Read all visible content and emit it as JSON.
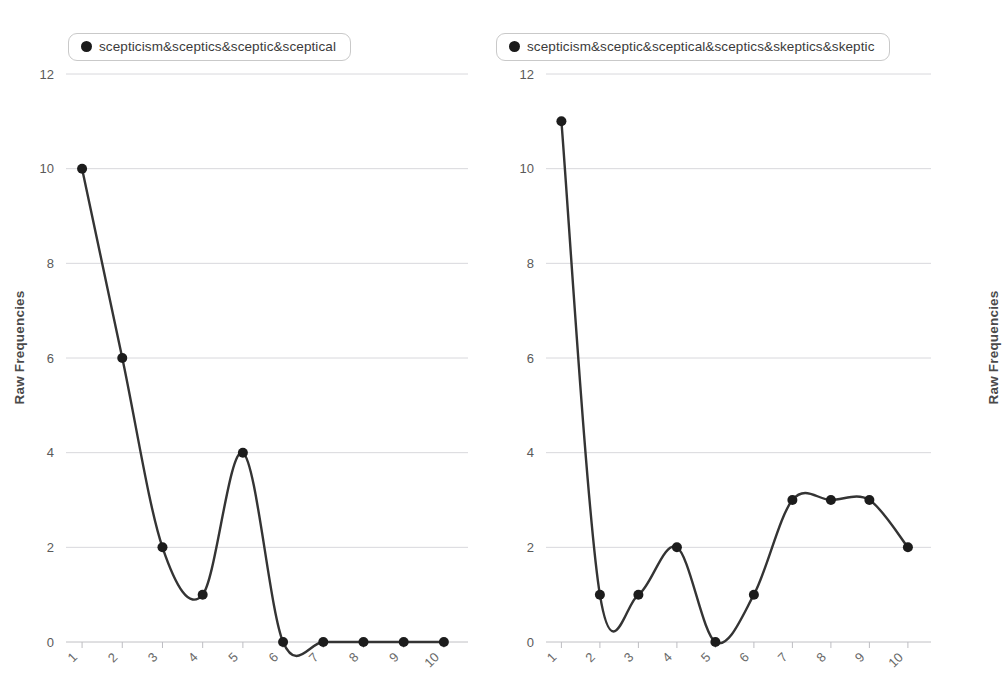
{
  "chart_data": [
    {
      "type": "line",
      "panel": "left",
      "title": "",
      "xlabel": "",
      "ylabel": "Raw Frequencies",
      "legend": "scepticism&sceptics&sceptic&sceptical",
      "legend_position": "top-left",
      "legend_marker": "filled-circle",
      "grid": true,
      "grid_axis": "y",
      "x": [
        1,
        2,
        3,
        4,
        5,
        6,
        7,
        8,
        9,
        10
      ],
      "xticklabels": [
        "1",
        "2",
        "3",
        "4",
        "5",
        "6",
        "7",
        "8",
        "9",
        "10"
      ],
      "xtick_rotation": -45,
      "yticks": [
        0,
        2,
        4,
        6,
        8,
        10,
        12
      ],
      "yticklabels": [
        "0",
        "2",
        "4",
        "6",
        "8",
        "10",
        "12"
      ],
      "ylim": [
        0,
        12
      ],
      "xlim": [
        0.6,
        10.6
      ],
      "interpolation": "smooth-spline",
      "values": [
        10,
        6,
        2,
        1,
        4,
        0,
        0,
        0,
        0,
        0
      ],
      "line_color": "#343434",
      "marker_color": "#1c1c1c"
    },
    {
      "type": "line",
      "panel": "right",
      "title": "",
      "xlabel": "",
      "ylabel": "Raw Frequencies",
      "legend": "scepticism&sceptic&sceptical&sceptics&skeptics&skeptic",
      "legend_position": "top-left",
      "legend_marker": "filled-circle",
      "grid": true,
      "grid_axis": "y",
      "x": [
        1,
        2,
        3,
        4,
        5,
        6,
        7,
        8,
        9,
        10
      ],
      "xticklabels": [
        "1",
        "2",
        "3",
        "4",
        "5",
        "6",
        "7",
        "8",
        "9",
        "10"
      ],
      "xtick_rotation": -45,
      "yticks": [
        0,
        2,
        4,
        6,
        8,
        10,
        12
      ],
      "yticklabels": [
        "0",
        "2",
        "4",
        "6",
        "8",
        "10",
        "12"
      ],
      "ylim": [
        0,
        12
      ],
      "xlim": [
        0.6,
        10.6
      ],
      "interpolation": "smooth-spline",
      "values": [
        11,
        1,
        1,
        2,
        0,
        1,
        3,
        3,
        3,
        2
      ],
      "line_color": "#343434",
      "marker_color": "#1c1c1c"
    }
  ],
  "colors": {
    "line": "#343434",
    "marker": "#1c1c1c",
    "gridline": "#d8d8dc",
    "axis": "#c0c0c4",
    "tick_text": "#5a5a5a",
    "axis_label": "#4a4a4a",
    "legend_border": "#c9c9c9",
    "background": "#ffffff"
  }
}
